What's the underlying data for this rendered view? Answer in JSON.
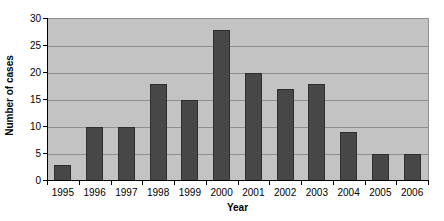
{
  "chart_data": {
    "type": "bar",
    "title": "",
    "xlabel": "Year",
    "ylabel": "Number of cases",
    "categories": [
      "1995",
      "1996",
      "1997",
      "1998",
      "1999",
      "2000",
      "2001",
      "2002",
      "2003",
      "2004",
      "2005",
      "2006"
    ],
    "values": [
      3,
      10,
      10,
      18,
      15,
      28,
      20,
      17,
      18,
      9,
      5,
      5
    ],
    "ylim": [
      0,
      30
    ],
    "yticks": [
      0,
      5,
      10,
      15,
      20,
      25,
      30
    ],
    "ytick_labels": [
      "0",
      "5",
      "10",
      "15",
      "20",
      "25",
      "30"
    ],
    "grid": true,
    "grid_axis": "y",
    "legend": false,
    "bar_color": "#474747",
    "plot_background": "#c3c3c3",
    "gridline_color": "#8f8f8f",
    "axis_color": "#000000",
    "page_background": "#ffffff"
  }
}
